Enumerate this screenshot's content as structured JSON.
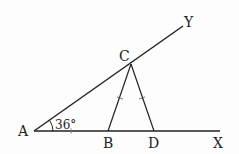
{
  "diagram": {
    "type": "geometry",
    "points": {
      "A": {
        "label": "A",
        "x": 34,
        "y": 131
      },
      "B": {
        "label": "B",
        "x": 108,
        "y": 131
      },
      "C": {
        "label": "C",
        "x": 131,
        "y": 64
      },
      "D": {
        "label": "D",
        "x": 154,
        "y": 131
      },
      "X": {
        "label": "X",
        "x": 220,
        "y": 131
      },
      "Y": {
        "label": "Y",
        "x": 183,
        "y": 26
      }
    },
    "angle_label": "36°",
    "segments": [
      "AX",
      "AY",
      "CB",
      "CD"
    ],
    "equal_marks": [
      "CB",
      "CD"
    ]
  }
}
